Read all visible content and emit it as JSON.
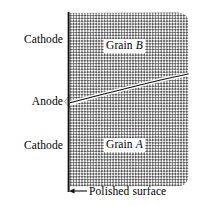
{
  "figure": {
    "width": 206,
    "height": 206,
    "background_color": "#ffffff",
    "line_color": "#1a1a1a",
    "hatch_color": "#555555"
  },
  "labels": {
    "cathode_top": "Cathode",
    "anode": "Anode",
    "cathode_bottom": "Cathode",
    "polished_surface": "Polished surface"
  },
  "grains": {
    "upper": {
      "prefix": "Grain",
      "name": "B"
    },
    "lower": {
      "prefix": "Grain",
      "name": "A"
    }
  },
  "geometry": {
    "surface_line": {
      "x": 68.5,
      "y_top": 12,
      "y_bottom": 192
    },
    "specimen_region": {
      "x_left": 69,
      "x_right": 188,
      "y_top": 12,
      "y_bottom": 186
    },
    "grain_boundary_points": "69,103 96,96 124,89 148,83 165,79 188,74",
    "anode_notch": {
      "x": 69,
      "y_top": 96,
      "y_bottom": 108,
      "depth": 6
    },
    "pointer_arrow": {
      "x_tip": 69,
      "x_tail": 87,
      "y": 191
    }
  }
}
